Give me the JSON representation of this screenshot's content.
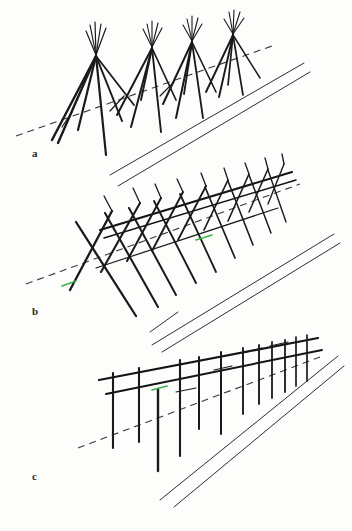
{
  "figure": {
    "background_color": "#fdfdfc",
    "ink_color": "#1a1a1a",
    "thin_line_color": "#2e2e2e",
    "dashed_line_color": "#3a3a3a",
    "artifact_mark_color": "#3cb54a",
    "width": 352,
    "height": 531
  },
  "panels": [
    {
      "id": "a",
      "label": "a",
      "label_x": 32,
      "label_y": 157,
      "name": "panel-a-tripod-stage",
      "description": "Row of four tripod / teepee pole clusters standing along a dashed ground line, with a double parallel line band running diagonally below-right.",
      "structure_type": "tripod-cluster",
      "cluster_count": 4,
      "apexes": [
        {
          "x": 96,
          "y": 55
        },
        {
          "x": 152,
          "y": 46
        },
        {
          "x": 192,
          "y": 40
        },
        {
          "x": 233,
          "y": 33
        }
      ]
    },
    {
      "id": "b",
      "label": "b",
      "label_x": 32,
      "label_y": 315,
      "name": "panel-b-crossed-pole-stage",
      "description": "Row of crossed (X shaped) pole pairs linked by a long ridge pole, standing on the dashed ground line, double parallel band below-right.",
      "structure_type": "crossed-pole-frame",
      "crossing_count": 9,
      "has_ridge_pole": true
    },
    {
      "id": "c",
      "label": "c",
      "label_x": 32,
      "label_y": 480,
      "name": "panel-c-vertical-post-stage",
      "description": "Row of vertical posts carrying two horizontal rails, standing on the dashed ground line, double parallel band below-right.",
      "structure_type": "post-and-rail-fence",
      "post_count": 12,
      "rail_count": 2
    }
  ],
  "common_elements": {
    "dashed_ground_line_label": "ground-line",
    "double_band_label": "parallel-band",
    "green_artifact_label": "scan-artifact"
  }
}
